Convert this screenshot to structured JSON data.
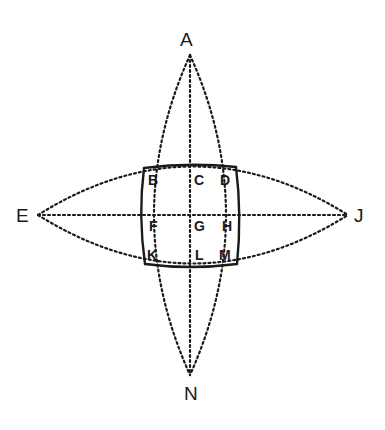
{
  "diagram": {
    "title": "",
    "colors": {
      "stroke": "#1a1a1a",
      "background": "#ffffff"
    },
    "outer_points": [
      {
        "id": "A",
        "label": "A",
        "position": "top",
        "x": 186,
        "y": 30
      },
      {
        "id": "E",
        "label": "E",
        "position": "left",
        "x": 16,
        "y": 206
      },
      {
        "id": "J",
        "label": "J",
        "position": "right",
        "x": 352,
        "y": 206
      },
      {
        "id": "N",
        "label": "N",
        "position": "bottom",
        "x": 184,
        "y": 384
      }
    ],
    "grid_points": [
      {
        "id": "B",
        "label": "B",
        "row": 0,
        "col": 0,
        "x": 149,
        "y": 172
      },
      {
        "id": "C",
        "label": "C",
        "row": 0,
        "col": 1,
        "x": 194,
        "y": 172
      },
      {
        "id": "D",
        "label": "D",
        "row": 0,
        "col": 2,
        "x": 221,
        "y": 172
      },
      {
        "id": "F",
        "label": "F",
        "row": 1,
        "col": 0,
        "x": 149,
        "y": 219
      },
      {
        "id": "G",
        "label": "G",
        "row": 1,
        "col": 1,
        "x": 194,
        "y": 219
      },
      {
        "id": "H",
        "label": "H",
        "row": 1,
        "col": 2,
        "x": 222,
        "y": 219
      },
      {
        "id": "K",
        "label": "K",
        "row": 2,
        "col": 0,
        "x": 148,
        "y": 248
      },
      {
        "id": "L",
        "label": "L",
        "row": 2,
        "col": 1,
        "x": 195,
        "y": 248
      },
      {
        "id": "M",
        "label": "M",
        "row": 2,
        "col": 2,
        "x": 221,
        "y": 248
      }
    ]
  }
}
